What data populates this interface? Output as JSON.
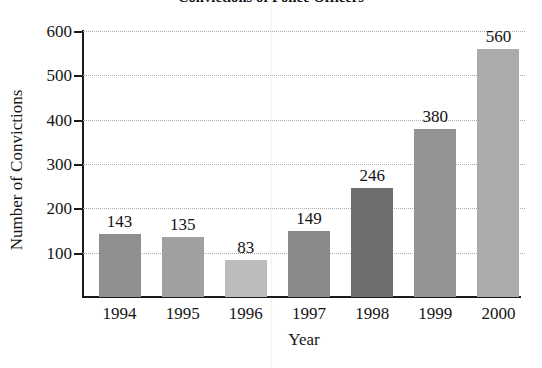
{
  "chart_data": {
    "type": "bar",
    "title": "Convictions of Police Officers",
    "xlabel": "Year",
    "ylabel": "Number of Convictions",
    "categories": [
      "1994",
      "1995",
      "1996",
      "1997",
      "1998",
      "1999",
      "2000"
    ],
    "values": [
      143,
      135,
      83,
      149,
      246,
      380,
      560
    ],
    "value_labels": [
      "143",
      "135",
      "83",
      "149",
      "246",
      "380",
      "560"
    ],
    "ylim": [
      0,
      600
    ],
    "yticks": [
      100,
      200,
      300,
      400,
      500,
      600
    ],
    "ytick_labels": [
      "100",
      "200",
      "300",
      "400",
      "500",
      "600"
    ],
    "grid": true,
    "gridline_style": "dotted",
    "legend": "none",
    "bar_colors": [
      "#8f8f8f",
      "#a0a0a0",
      "#bcbcbc",
      "#8a8a8a",
      "#6e6e6e",
      "#939393",
      "#ababab"
    ],
    "axis_color": "#1a1a1a",
    "background_color": "#ffffff"
  }
}
